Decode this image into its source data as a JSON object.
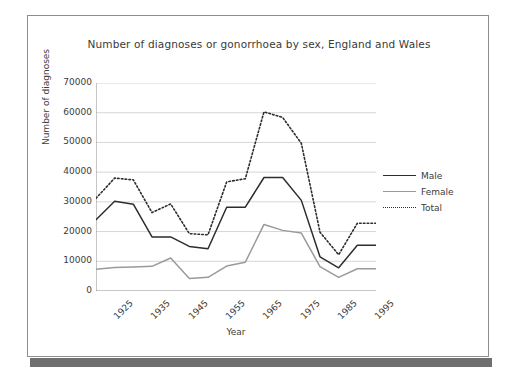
{
  "chart_data": {
    "type": "line",
    "title": "Number of diagnoses or gonorrhoea by sex, England and Wales",
    "xlabel": "Year",
    "ylabel": "Number of diagnoses",
    "ylim": [
      0,
      70000
    ],
    "y_ticks": [
      "0",
      "10000",
      "20000",
      "30000",
      "40000",
      "50000",
      "60000",
      "70000"
    ],
    "y_tick_values": [
      0,
      10000,
      20000,
      30000,
      40000,
      50000,
      60000,
      70000
    ],
    "x_tick_labels": [
      "1925",
      "1935",
      "1945",
      "1955",
      "1965",
      "1975",
      "1985",
      "1995"
    ],
    "x_tick_values": [
      1925,
      1935,
      1945,
      1955,
      1965,
      1975,
      1985,
      1995
    ],
    "xlim": [
      1925,
      2000
    ],
    "x": [
      1925,
      1930,
      1935,
      1940,
      1945,
      1950,
      1955,
      1960,
      1965,
      1970,
      1975,
      1980,
      1985,
      1990,
      1995,
      2000
    ],
    "grid": "horizontal",
    "legend_position": "right",
    "series": [
      {
        "name": "Male",
        "style": "solid",
        "color": "#2d2d2d",
        "values": [
          24000,
          30200,
          29200,
          18200,
          18200,
          15000,
          14200,
          28200,
          28200,
          38200,
          38200,
          30500,
          11500,
          7800,
          15400,
          15400
        ]
      },
      {
        "name": "Female",
        "style": "solid",
        "color": "#9a9a9a",
        "values": [
          7300,
          7900,
          8100,
          8300,
          11100,
          4200,
          4600,
          8400,
          9700,
          22400,
          20400,
          19500,
          8200,
          4600,
          7500,
          7500
        ]
      },
      {
        "name": "Total",
        "style": "dotted",
        "color": "#2d2d2d",
        "values": [
          31200,
          38000,
          37400,
          26400,
          29300,
          19300,
          18900,
          36700,
          37800,
          60300,
          58400,
          49700,
          19800,
          12200,
          22800,
          22800
        ]
      }
    ]
  },
  "legend": {
    "items": [
      {
        "label": "Male",
        "style": "solid",
        "color": "#2d2d2d"
      },
      {
        "label": "Female",
        "style": "solid",
        "color": "#9a9a9a"
      },
      {
        "label": "Total",
        "style": "dotted",
        "color": "#2d2d2d"
      }
    ]
  }
}
